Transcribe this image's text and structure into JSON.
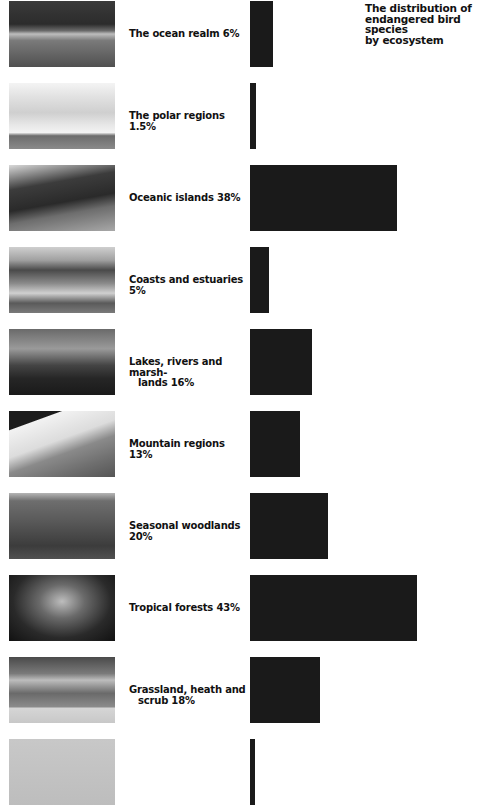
{
  "title": "The distribution of endangered bird species by ecosystem",
  "title_lines": [
    "The distribution of",
    "endangered bird species",
    "by ecosystem"
  ],
  "rows": [
    {
      "label_line1": "The ocean realm 6%",
      "label_line2": "",
      "value": 6,
      "photo": "ocean",
      "top": 1
    },
    {
      "label_line1": "The polar regions 1.5%",
      "label_line2": "",
      "value": 1.5,
      "photo": "polar",
      "top": 83
    },
    {
      "label_line1": "Oceanic islands 38%",
      "label_line2": "",
      "value": 38,
      "photo": "islands",
      "top": 165
    },
    {
      "label_line1": "Coasts and estuaries 5%",
      "label_line2": "",
      "value": 5,
      "photo": "coasts",
      "top": 247
    },
    {
      "label_line1": "Lakes, rivers and marsh-",
      "label_line2": "lands 16%",
      "value": 16,
      "photo": "lakes",
      "top": 329
    },
    {
      "label_line1": "Mountain regions 13%",
      "label_line2": "",
      "value": 13,
      "photo": "mountain",
      "top": 411
    },
    {
      "label_line1": "Seasonal woodlands 20%",
      "label_line2": "",
      "value": 20,
      "photo": "woodlands",
      "top": 493
    },
    {
      "label_line1": "Tropical forests 43%",
      "label_line2": "",
      "value": 43,
      "photo": "tropical",
      "top": 575
    },
    {
      "label_line1": "Grassland, heath and",
      "label_line2": "scrub 18%",
      "value": 18,
      "photo": "grassland",
      "top": 657
    },
    {
      "label_line1": "",
      "label_line2": "",
      "value": 1,
      "photo": "partial",
      "top": 739
    }
  ],
  "colors": {
    "bar": "#1a1a1a",
    "text": "#111111",
    "background": "#ffffff"
  },
  "chart_data": {
    "type": "bar",
    "orientation": "horizontal",
    "title": "The distribution of endangered bird species by ecosystem",
    "categories": [
      "The ocean realm",
      "The polar regions",
      "Oceanic islands",
      "Coasts and estuaries",
      "Lakes, rivers and marshlands",
      "Mountain regions",
      "Seasonal woodlands",
      "Tropical forests",
      "Grassland, heath and scrub"
    ],
    "values": [
      6,
      1.5,
      38,
      5,
      16,
      13,
      20,
      43,
      18
    ],
    "unit": "%",
    "xlabel": "",
    "ylabel": "",
    "grid": false,
    "legend": "none"
  }
}
